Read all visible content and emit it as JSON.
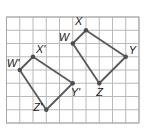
{
  "diagram": {
    "type": "coordinate-grid-transformation",
    "grid": {
      "columns": 10,
      "rows": 8,
      "origin_px": [
        6.5,
        17
      ],
      "cell_px": 13.25,
      "line_color": "#b9b9b9"
    },
    "polygon_color": "#5a5a5a",
    "vertex_color": "#4d4d4d",
    "shapes": [
      {
        "name": "WXYZ",
        "vertices": [
          {
            "label": "W",
            "grid": [
              5,
              2
            ],
            "label_offset": [
              -14,
              -3
            ]
          },
          {
            "label": "X",
            "grid": [
              6,
              1
            ],
            "label_offset": [
              -11,
              -5
            ]
          },
          {
            "label": "Y",
            "grid": [
              9,
              3
            ],
            "label_offset": [
              3,
              -3
            ]
          },
          {
            "label": "Z",
            "grid": [
              7,
              5
            ],
            "label_offset": [
              -3,
              13
            ]
          }
        ]
      },
      {
        "name": "W'X'Y'Z'",
        "vertices": [
          {
            "label": "W'",
            "grid": [
              1,
              4
            ],
            "label_offset": [
              -13,
              -3
            ]
          },
          {
            "label": "X'",
            "grid": [
              2,
              3
            ],
            "label_offset": [
              3,
              -4
            ]
          },
          {
            "label": "Y'",
            "grid": [
              5,
              5
            ],
            "label_offset": [
              -2,
              13
            ]
          },
          {
            "label": "Z'",
            "grid": [
              3,
              7
            ],
            "label_offset": [
              -13,
              1
            ]
          }
        ]
      }
    ]
  }
}
